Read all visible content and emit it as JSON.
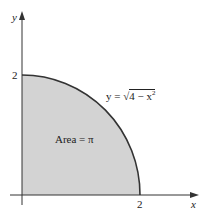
{
  "diagram": {
    "colors": {
      "fill": "#d3d3d3",
      "curve": "#333333",
      "axis": "#333333",
      "text": "#222222"
    },
    "axes": {
      "x_label": "x",
      "y_label": "y",
      "x_tick": "2",
      "y_tick": "2"
    },
    "curve_label": {
      "prefix": "y = ",
      "radicand": "4 − x",
      "exponent": "2"
    },
    "region_label": "Area = π"
  }
}
